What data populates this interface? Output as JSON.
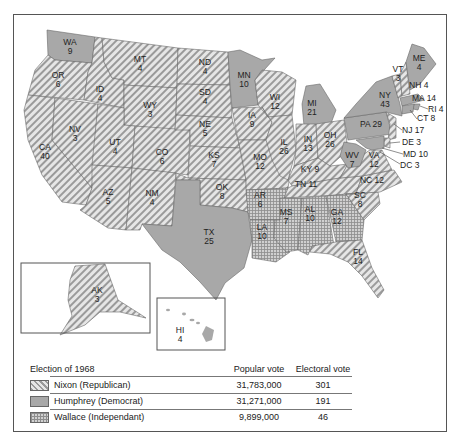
{
  "map": {
    "colors": {
      "nixon_stripe": "#9a9a9a",
      "nixon_bg": "#e6e6e6",
      "humphrey": "#a8a8a8",
      "wallace_grid": "#8d8d8d",
      "wallace_bg": "#d0d0d0"
    },
    "states": {
      "WA": {
        "abbr": "WA",
        "ev": "9",
        "winner": "humphrey"
      },
      "OR": {
        "abbr": "OR",
        "ev": "6",
        "winner": "nixon"
      },
      "CA": {
        "abbr": "CA",
        "ev": "40",
        "winner": "nixon"
      },
      "ID": {
        "abbr": "ID",
        "ev": "4",
        "winner": "nixon"
      },
      "NV": {
        "abbr": "NV",
        "ev": "3",
        "winner": "nixon"
      },
      "MT": {
        "abbr": "MT",
        "ev": "4",
        "winner": "nixon"
      },
      "WY": {
        "abbr": "WY",
        "ev": "3",
        "winner": "nixon"
      },
      "UT": {
        "abbr": "UT",
        "ev": "4",
        "winner": "nixon"
      },
      "AZ": {
        "abbr": "AZ",
        "ev": "5",
        "winner": "nixon"
      },
      "CO": {
        "abbr": "CO",
        "ev": "6",
        "winner": "nixon"
      },
      "NM": {
        "abbr": "NM",
        "ev": "4",
        "winner": "nixon"
      },
      "ND": {
        "abbr": "ND",
        "ev": "4",
        "winner": "nixon"
      },
      "SD": {
        "abbr": "SD",
        "ev": "4",
        "winner": "nixon"
      },
      "NE": {
        "abbr": "NE",
        "ev": "5",
        "winner": "nixon"
      },
      "KS": {
        "abbr": "KS",
        "ev": "7",
        "winner": "nixon"
      },
      "OK": {
        "abbr": "OK",
        "ev": "8",
        "winner": "nixon"
      },
      "TX": {
        "abbr": "TX",
        "ev": "25",
        "winner": "humphrey"
      },
      "MN": {
        "abbr": "MN",
        "ev": "10",
        "winner": "humphrey"
      },
      "IA": {
        "abbr": "IA",
        "ev": "9",
        "winner": "nixon"
      },
      "MO": {
        "abbr": "MO",
        "ev": "12",
        "winner": "nixon"
      },
      "AR": {
        "abbr": "AR",
        "ev": "6",
        "winner": "wallace"
      },
      "LA": {
        "abbr": "LA",
        "ev": "10",
        "winner": "wallace"
      },
      "WI": {
        "abbr": "WI",
        "ev": "12",
        "winner": "nixon"
      },
      "IL": {
        "abbr": "IL",
        "ev": "26",
        "winner": "nixon"
      },
      "MI": {
        "abbr": "MI",
        "ev": "21",
        "winner": "humphrey"
      },
      "IN": {
        "abbr": "IN",
        "ev": "13",
        "winner": "nixon"
      },
      "OH": {
        "abbr": "OH",
        "ev": "26",
        "winner": "nixon"
      },
      "KY": {
        "abbr": "KY",
        "ev": "9",
        "winner": "nixon"
      },
      "TN": {
        "abbr": "TN",
        "ev": "11",
        "winner": "nixon"
      },
      "MS": {
        "abbr": "MS",
        "ev": "7",
        "winner": "wallace"
      },
      "AL": {
        "abbr": "AL",
        "ev": "10",
        "winner": "wallace"
      },
      "GA": {
        "abbr": "GA",
        "ev": "12",
        "winner": "wallace"
      },
      "FL": {
        "abbr": "FL",
        "ev": "14",
        "winner": "nixon"
      },
      "SC": {
        "abbr": "SC",
        "ev": "8",
        "winner": "nixon"
      },
      "NC": {
        "abbr": "NC",
        "ev": "12",
        "winner": "nixon"
      },
      "VA": {
        "abbr": "VA",
        "ev": "12",
        "winner": "nixon"
      },
      "WV": {
        "abbr": "WV",
        "ev": "7",
        "winner": "humphrey"
      },
      "PA": {
        "abbr": "PA",
        "ev": "29",
        "winner": "humphrey"
      },
      "NY": {
        "abbr": "NY",
        "ev": "43",
        "winner": "humphrey"
      },
      "VT": {
        "abbr": "VT",
        "ev": "3",
        "winner": "nixon"
      },
      "NH": {
        "abbr": "NH",
        "ev": "4",
        "winner": "nixon"
      },
      "ME": {
        "abbr": "ME",
        "ev": "4",
        "winner": "humphrey"
      },
      "MA": {
        "abbr": "MA",
        "ev": "14",
        "winner": "humphrey"
      },
      "RI": {
        "abbr": "RI",
        "ev": "4",
        "winner": "humphrey"
      },
      "CT": {
        "abbr": "CT",
        "ev": "8",
        "winner": "humphrey"
      },
      "NJ": {
        "abbr": "NJ",
        "ev": "17",
        "winner": "nixon"
      },
      "DE": {
        "abbr": "DE",
        "ev": "3",
        "winner": "nixon"
      },
      "MD": {
        "abbr": "MD",
        "ev": "10",
        "winner": "humphrey"
      },
      "DC": {
        "abbr": "DC",
        "ev": "3",
        "winner": "humphrey"
      },
      "AK": {
        "abbr": "AK",
        "ev": "3",
        "winner": "nixon"
      },
      "HI": {
        "abbr": "HI",
        "ev": "4",
        "winner": "humphrey"
      }
    },
    "combined_labels": {
      "KY": "KY 9",
      "TN": "TN 11",
      "NC": "NC 12",
      "PA": "PA 29",
      "NH": "NH 4",
      "MA": "MA 14",
      "RI": "RI 4",
      "CT": "CT 8",
      "NJ": "NJ 17",
      "DE": "DE 3",
      "MD": "MD 10",
      "DC": "DC 3"
    }
  },
  "legend": {
    "title": "Election of 1968",
    "col_popular": "Popular vote",
    "col_electoral": "Electoral vote",
    "rows": [
      {
        "candidate": "Nixon (Republican)",
        "popular": "31,783,000",
        "electoral": "301",
        "pattern": "diagonal-stripes"
      },
      {
        "candidate": "Humphrey (Democrat)",
        "popular": "31,271,000",
        "electoral": "191",
        "pattern": "solid-gray"
      },
      {
        "candidate": "Wallace (Independant)",
        "popular": "9,899,000",
        "electoral": "46",
        "pattern": "crosshatch-grid"
      }
    ]
  }
}
